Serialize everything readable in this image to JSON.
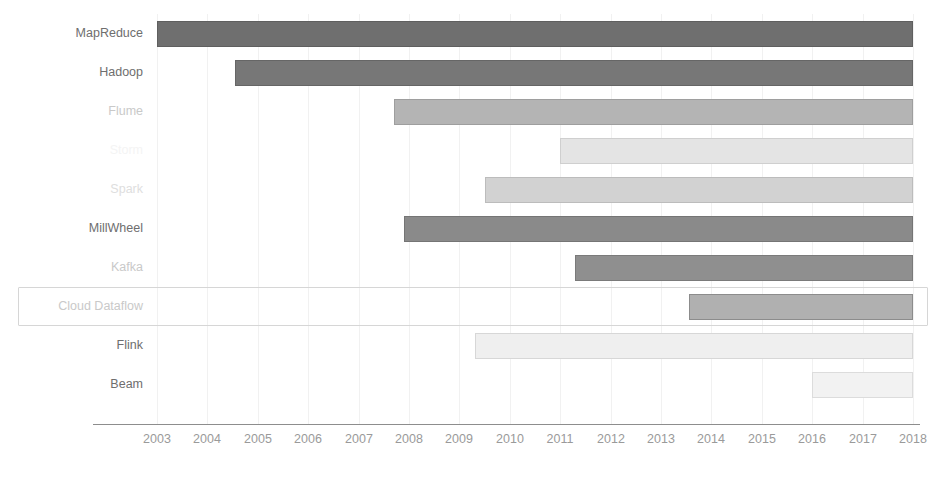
{
  "chart_data": {
    "type": "bar",
    "orientation": "horizontal",
    "subtype": "gantt-timeline",
    "title": "",
    "xlabel": "",
    "ylabel": "",
    "xlim": [
      2002.6,
      2018.4
    ],
    "grid": true,
    "legend": false,
    "tick_labels": [
      "2003",
      "2004",
      "2005",
      "2006",
      "2007",
      "2008",
      "2009",
      "2010",
      "2011",
      "2012",
      "2013",
      "2014",
      "2015",
      "2016",
      "2017",
      "2018"
    ],
    "categories": [
      "MapReduce",
      "Hadoop",
      "Flume",
      "Storm",
      "Spark",
      "MillWheel",
      "Kafka",
      "Cloud Dataflow",
      "Flink",
      "Beam"
    ],
    "bars": [
      {
        "label": "MapReduce",
        "start": 2003.0,
        "end": 2018.0,
        "fill": "#6f6f6f",
        "border": "#5f5f5f",
        "label_color": "#6e6e6e",
        "label_style": "normal",
        "highlighted": false
      },
      {
        "label": "Hadoop",
        "start": 2004.55,
        "end": 2018.0,
        "fill": "#777777",
        "border": "#666666",
        "label_color": "#6e6e6e",
        "label_style": "normal",
        "highlighted": false
      },
      {
        "label": "Flume",
        "start": 2007.7,
        "end": 2018.0,
        "fill": "#b4b4b4",
        "border": "#9e9e9e",
        "label_color": "#c9c9c9",
        "label_style": "dim",
        "highlighted": false
      },
      {
        "label": "Storm",
        "start": 2011.0,
        "end": 2018.0,
        "fill": "#e4e4e4",
        "border": "#cfcfcf",
        "label_color": "#f4f4f4",
        "label_style": "ghost",
        "highlighted": false
      },
      {
        "label": "Spark",
        "start": 2009.5,
        "end": 2018.0,
        "fill": "#d2d2d2",
        "border": "#bcbcbc",
        "label_color": "#dedede",
        "label_style": "dimmer",
        "highlighted": false
      },
      {
        "label": "MillWheel",
        "start": 2007.9,
        "end": 2018.0,
        "fill": "#8a8a8a",
        "border": "#757575",
        "label_color": "#6e6e6e",
        "label_style": "normal",
        "highlighted": false
      },
      {
        "label": "Kafka",
        "start": 2011.3,
        "end": 2018.0,
        "fill": "#8f8f8f",
        "border": "#7a7a7a",
        "label_color": "#c9c9c9",
        "label_style": "dim",
        "highlighted": false
      },
      {
        "label": "Cloud Dataflow",
        "start": 2013.55,
        "end": 2018.0,
        "fill": "#b0b0b0",
        "border": "#8c8c8c",
        "label_color": "#c9c9c9",
        "label_style": "dim",
        "highlighted": true
      },
      {
        "label": "Flink",
        "start": 2009.3,
        "end": 2018.0,
        "fill": "#efefef",
        "border": "#d7d7d7",
        "label_color": "#6e6e6e",
        "label_style": "normal",
        "highlighted": false
      },
      {
        "label": "Beam",
        "start": 2016.0,
        "end": 2018.0,
        "fill": "#f2f2f2",
        "border": "#dcdcdc",
        "label_color": "#6e6e6e",
        "label_style": "normal",
        "highlighted": false
      }
    ]
  },
  "colors": {
    "background": "#ffffff",
    "axis": "#8d8d8d",
    "gridline": "#f1f1f1",
    "tick_text": "#9a9a9a",
    "highlight_border": "#d6d6d6"
  }
}
